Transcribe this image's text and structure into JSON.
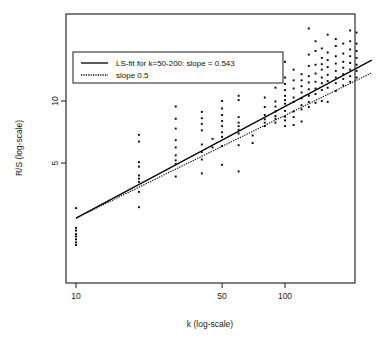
{
  "chart_data": {
    "type": "scatter",
    "title": "",
    "xlabel": "k (log-scale)",
    "ylabel": "R/S (log-scale)",
    "xscale": "log",
    "yscale": "log",
    "grid": false,
    "xticks": [
      10,
      50,
      100
    ],
    "xtick_labels": [
      "10",
      "50",
      "100"
    ],
    "yticks": [
      5,
      10
    ],
    "ytick_labels": [
      "5",
      "10"
    ],
    "xlim": [
      8.9,
      265
    ],
    "ylim": [
      1.95,
      26
    ],
    "legend": {
      "position": "top-left",
      "entries": [
        {
          "label": "LS-fit for k=50-200: slope = 0.543",
          "style": "solid",
          "color": "#000000"
        },
        {
          "label": "slope 0.5",
          "style": "dotted",
          "color": "#000000"
        }
      ]
    },
    "series": [
      {
        "name": "R/S statistic",
        "marker": "point",
        "color": "#000000",
        "points": [
          [
            10,
            3.02
          ],
          [
            10,
            2.42
          ],
          [
            10,
            2.35
          ],
          [
            10,
            2.26
          ],
          [
            10,
            2.2
          ],
          [
            10,
            2.13
          ],
          [
            10,
            2.06
          ],
          [
            10,
            2.0
          ],
          [
            20,
            6.85
          ],
          [
            20,
            6.35
          ],
          [
            20,
            5.05
          ],
          [
            20,
            4.8
          ],
          [
            20,
            4.35
          ],
          [
            20,
            4.2
          ],
          [
            20,
            4.05
          ],
          [
            20,
            3.62
          ],
          [
            20,
            3.05
          ],
          [
            30,
            9.4
          ],
          [
            30,
            8.2
          ],
          [
            30,
            7.35
          ],
          [
            30,
            6.45
          ],
          [
            30,
            5.95
          ],
          [
            30,
            5.45
          ],
          [
            30,
            5.15
          ],
          [
            30,
            4.95
          ],
          [
            30,
            4.3
          ],
          [
            40,
            8.85
          ],
          [
            40,
            8.25
          ],
          [
            40,
            7.75
          ],
          [
            40,
            7.2
          ],
          [
            40,
            6.15
          ],
          [
            40,
            5.65
          ],
          [
            40,
            5.2
          ],
          [
            40,
            4.45
          ],
          [
            45,
            6.55
          ],
          [
            45,
            5.95
          ],
          [
            50,
            10.0
          ],
          [
            50,
            9.2
          ],
          [
            50,
            8.55
          ],
          [
            50,
            8.0
          ],
          [
            50,
            7.55
          ],
          [
            50,
            7.05
          ],
          [
            50,
            6.7
          ],
          [
            50,
            6.05
          ],
          [
            50,
            4.9
          ],
          [
            60,
            10.6
          ],
          [
            60,
            10.1
          ],
          [
            60,
            8.35
          ],
          [
            60,
            7.85
          ],
          [
            60,
            7.55
          ],
          [
            60,
            7.25
          ],
          [
            60,
            6.95
          ],
          [
            60,
            6.1
          ],
          [
            60,
            4.55
          ],
          [
            70,
            6.8
          ],
          [
            70,
            6.25
          ],
          [
            80,
            10.4
          ],
          [
            80,
            9.35
          ],
          [
            80,
            8.55
          ],
          [
            80,
            8.15
          ],
          [
            80,
            7.85
          ],
          [
            80,
            7.55
          ],
          [
            90,
            11.6
          ],
          [
            90,
            9.95
          ],
          [
            90,
            9.4
          ],
          [
            90,
            8.9
          ],
          [
            90,
            8.45
          ],
          [
            90,
            8.2
          ],
          [
            90,
            7.85
          ],
          [
            100,
            15.5
          ],
          [
            100,
            13.0
          ],
          [
            100,
            12.1
          ],
          [
            100,
            11.3
          ],
          [
            100,
            10.6
          ],
          [
            100,
            10.1
          ],
          [
            100,
            9.7
          ],
          [
            100,
            8.95
          ],
          [
            100,
            8.4
          ],
          [
            100,
            8.05
          ],
          [
            100,
            7.55
          ],
          [
            110,
            14.2
          ],
          [
            110,
            12.6
          ],
          [
            110,
            11.5
          ],
          [
            110,
            10.4
          ],
          [
            110,
            9.9
          ],
          [
            110,
            8.9
          ],
          [
            110,
            8.35
          ],
          [
            110,
            7.65
          ],
          [
            120,
            13.5
          ],
          [
            120,
            12.6
          ],
          [
            120,
            11.8
          ],
          [
            120,
            11.0
          ],
          [
            120,
            10.3
          ],
          [
            120,
            9.55
          ],
          [
            120,
            9.1
          ],
          [
            120,
            7.95
          ],
          [
            130,
            22.5
          ],
          [
            130,
            16.8
          ],
          [
            130,
            14.8
          ],
          [
            130,
            13.2
          ],
          [
            130,
            12.3
          ],
          [
            130,
            11.4
          ],
          [
            130,
            10.6
          ],
          [
            130,
            9.9
          ],
          [
            130,
            9.35
          ],
          [
            140,
            19.5
          ],
          [
            140,
            17.5
          ],
          [
            140,
            15.0
          ],
          [
            140,
            13.6
          ],
          [
            140,
            12.4
          ],
          [
            140,
            11.5
          ],
          [
            140,
            10.8
          ],
          [
            140,
            9.8
          ],
          [
            150,
            18.0
          ],
          [
            150,
            16.2
          ],
          [
            150,
            15.1
          ],
          [
            150,
            14.2
          ],
          [
            150,
            13.0
          ],
          [
            150,
            12.2
          ],
          [
            150,
            11.3
          ],
          [
            150,
            10.0
          ],
          [
            160,
            21.0
          ],
          [
            160,
            17.2
          ],
          [
            160,
            15.8
          ],
          [
            160,
            14.6
          ],
          [
            160,
            13.4
          ],
          [
            160,
            12.5
          ],
          [
            160,
            11.6
          ],
          [
            160,
            9.9
          ],
          [
            175,
            20.0
          ],
          [
            175,
            18.5
          ],
          [
            175,
            16.5
          ],
          [
            175,
            15.2
          ],
          [
            175,
            14.0
          ],
          [
            175,
            13.0
          ],
          [
            175,
            12.2
          ],
          [
            175,
            11.2
          ],
          [
            190,
            19.0
          ],
          [
            190,
            17.0
          ],
          [
            190,
            15.5
          ],
          [
            190,
            14.5
          ],
          [
            190,
            13.5
          ],
          [
            190,
            12.8
          ],
          [
            190,
            11.9
          ],
          [
            205,
            22.0
          ],
          [
            205,
            19.5
          ],
          [
            205,
            17.8
          ],
          [
            205,
            16.5
          ],
          [
            205,
            15.3
          ],
          [
            205,
            14.2
          ],
          [
            205,
            13.2
          ],
          [
            205,
            12.4
          ],
          [
            220,
            21.5
          ],
          [
            220,
            19.0
          ],
          [
            220,
            17.5
          ],
          [
            220,
            16.2
          ],
          [
            220,
            15.0
          ],
          [
            220,
            14.0
          ],
          [
            220,
            13.0
          ],
          [
            235,
            23.5
          ],
          [
            235,
            20.5
          ],
          [
            235,
            19.0
          ],
          [
            235,
            17.5
          ],
          [
            235,
            16.3
          ],
          [
            235,
            15.2
          ],
          [
            235,
            14.3
          ],
          [
            235,
            13.4
          ],
          [
            250,
            22.0
          ],
          [
            250,
            20.0
          ],
          [
            250,
            18.6
          ],
          [
            250,
            17.3
          ],
          [
            250,
            16.1
          ],
          [
            250,
            15.0
          ],
          [
            250,
            14.0
          ],
          [
            258,
            23.0
          ],
          [
            258,
            21.0
          ],
          [
            258,
            19.2
          ],
          [
            258,
            17.8
          ],
          [
            258,
            16.5
          ],
          [
            258,
            15.4
          ],
          [
            258,
            14.4
          ]
        ]
      }
    ],
    "fit_lines": [
      {
        "name": "ls-fit",
        "slope": 0.543,
        "style": "solid",
        "x_start": 10,
        "y_start": 2.7,
        "x_end": 260,
        "y_end": 15.8
      },
      {
        "name": "reference-slope-half",
        "slope": 0.5,
        "style": "dotted",
        "x_start": 10,
        "y_start": 2.7,
        "x_end": 260,
        "y_end": 13.7
      }
    ]
  }
}
